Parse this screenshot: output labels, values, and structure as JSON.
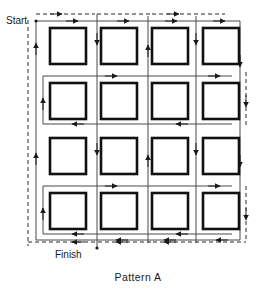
{
  "figure": {
    "caption": "Pattern A",
    "start_label": "Start",
    "finish_label": "Finish",
    "colors": {
      "ink": "#1a1a1a",
      "path_solid": "#4a4a4a",
      "path_dashed": "#2b2b2b",
      "square_border": "#111111",
      "background": "#ffffff"
    },
    "grid": {
      "rows": 4,
      "columns": 4,
      "cell_count": 16,
      "square_size": 36,
      "column_x": [
        50,
        101,
        152,
        203
      ],
      "row_y": [
        44,
        99,
        154,
        209
      ]
    },
    "path": {
      "type": "serpentine-raster",
      "solid_label": "cutting-pass",
      "dashed_label": "rapid-traverse",
      "start_point_x": 36,
      "start_point_y": 21,
      "finish_point_x": 97,
      "finish_point_y": 248
    },
    "squares": [
      {
        "id": "square-r1c1",
        "row": 1,
        "col": 1
      },
      {
        "id": "square-r1c2",
        "row": 1,
        "col": 2
      },
      {
        "id": "square-r1c3",
        "row": 1,
        "col": 3
      },
      {
        "id": "square-r1c4",
        "row": 1,
        "col": 4
      },
      {
        "id": "square-r2c1",
        "row": 2,
        "col": 1
      },
      {
        "id": "square-r2c2",
        "row": 2,
        "col": 2
      },
      {
        "id": "square-r2c3",
        "row": 2,
        "col": 3
      },
      {
        "id": "square-r2c4",
        "row": 2,
        "col": 4
      },
      {
        "id": "square-r3c1",
        "row": 3,
        "col": 1
      },
      {
        "id": "square-r3c2",
        "row": 3,
        "col": 2
      },
      {
        "id": "square-r3c3",
        "row": 3,
        "col": 3
      },
      {
        "id": "square-r3c4",
        "row": 3,
        "col": 4
      },
      {
        "id": "square-r4c1",
        "row": 4,
        "col": 1
      },
      {
        "id": "square-r4c2",
        "row": 4,
        "col": 2
      },
      {
        "id": "square-r4c3",
        "row": 4,
        "col": 3
      },
      {
        "id": "square-r4c4",
        "row": 4,
        "col": 4
      }
    ]
  }
}
